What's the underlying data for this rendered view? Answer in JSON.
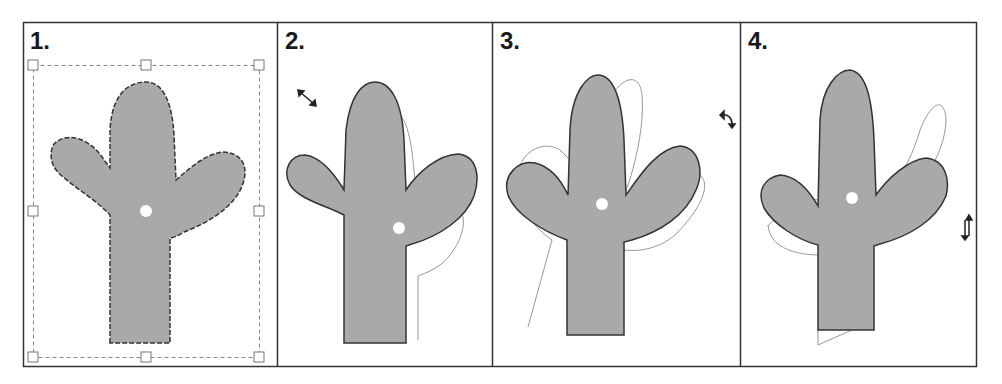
{
  "figure": {
    "panels": [
      {
        "label": "1.",
        "step": "select",
        "description": "Shape selected with bounding box and 8 resize handles"
      },
      {
        "label": "2.",
        "step": "resize",
        "description": "Shape scaled; original outline shown behind",
        "cursor_icon": "diagonal-resize-icon"
      },
      {
        "label": "3.",
        "step": "rotate",
        "description": "Shape rotated; original outline shown behind",
        "cursor_icon": "rotate-icon"
      },
      {
        "label": "4.",
        "step": "flip",
        "description": "Shape skewed/flipped; original outline shown behind",
        "cursor_icon": "flip-vertical-icon"
      }
    ],
    "colors": {
      "shape_fill": "#a9a9a9",
      "shape_stroke": "#333333",
      "ghost_outline": "#9a9a9a",
      "frame": "#333333",
      "handle_stroke": "#888888",
      "dot": "#ffffff"
    }
  }
}
